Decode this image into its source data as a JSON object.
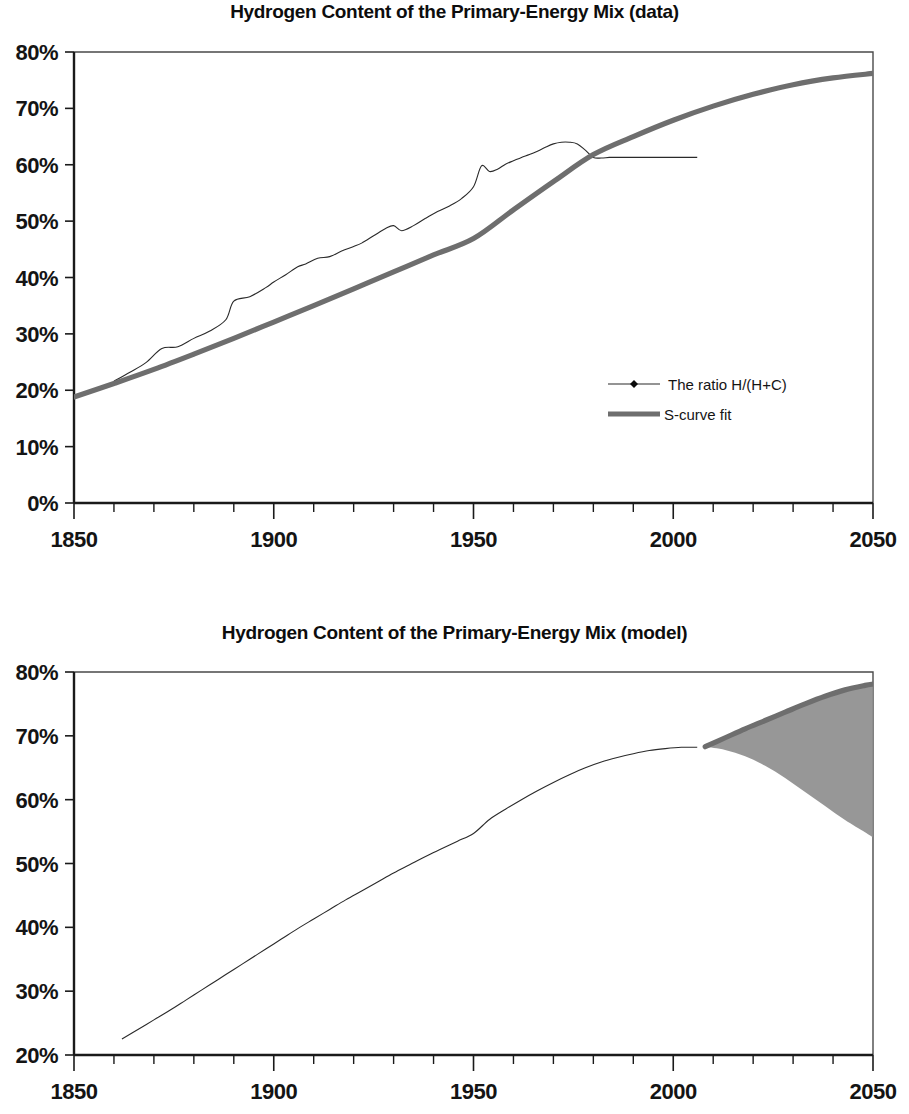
{
  "page": {
    "width": 909,
    "height": 1114,
    "background": "#ffffff",
    "text_color": "#0d0d0d"
  },
  "colors": {
    "scurve_gray": "#6e6e6e",
    "marker_black": "#0b0b0b",
    "band_fill": "#8e8e8e",
    "axis": "#1a1a1a",
    "frame": "#4a4a4a"
  },
  "figures": [
    {
      "id": "figure-data",
      "title": "Hydrogen Content of the Primary-Energy Mix (data)",
      "legend": {
        "position": "inside-right",
        "entries": [
          {
            "label": "The ratio H/(H+C)",
            "style": "line-with-diamond-markers",
            "color": "#2a2a2a"
          },
          {
            "label": "S-curve fit",
            "style": "thick-line",
            "color": "#6e6e6e"
          }
        ]
      }
    },
    {
      "id": "figure-model",
      "title": "Hydrogen Content of the Primary-Energy Mix (model)",
      "legend": {
        "position": "none",
        "entries": []
      }
    }
  ],
  "chart_data": [
    {
      "type": "line",
      "id": "figure-data",
      "title": "Hydrogen Content of the Primary-Energy Mix (data)",
      "xlabel": "",
      "ylabel": "",
      "xlim": [
        1850,
        2050
      ],
      "ylim": [
        0,
        0.8
      ],
      "x_major_ticks": [
        1850,
        1900,
        1950,
        2000,
        2050
      ],
      "x_major_tick_labels": [
        "1850",
        "1900",
        "1950",
        "2000",
        "2050"
      ],
      "x_minor_tick_step": 10,
      "y_ticks": [
        0,
        0.1,
        0.2,
        0.3,
        0.4,
        0.5,
        0.6,
        0.7,
        0.8
      ],
      "y_tick_labels": [
        "0%",
        "10%",
        "20%",
        "30%",
        "40%",
        "50%",
        "60%",
        "70%",
        "80%"
      ],
      "grid": false,
      "legend_position": "inside-right",
      "series": [
        {
          "name": "The ratio H/(H+C)",
          "style": "line-with-diamond-markers",
          "color": "#0b0b0b",
          "x": [
            1860,
            1864,
            1868,
            1872,
            1876,
            1880,
            1884,
            1888,
            1890,
            1894,
            1898,
            1900,
            1903,
            1906,
            1908,
            1911,
            1914,
            1917,
            1920,
            1922,
            1925,
            1928,
            1930,
            1932,
            1935,
            1938,
            1941,
            1944,
            1947,
            1950,
            1952,
            1954,
            1956,
            1958,
            1960,
            1962,
            1964,
            1966,
            1968,
            1970,
            1972,
            1974,
            1976,
            1978,
            1980,
            1982,
            1984,
            1986,
            1988,
            1990,
            1992,
            1994,
            1996,
            1998,
            2000,
            2002,
            2004,
            2006
          ],
          "y": [
            0.216,
            0.232,
            0.249,
            0.274,
            0.277,
            0.292,
            0.305,
            0.325,
            0.358,
            0.366,
            0.382,
            0.392,
            0.405,
            0.419,
            0.424,
            0.434,
            0.437,
            0.447,
            0.455,
            0.461,
            0.474,
            0.487,
            0.492,
            0.483,
            0.492,
            0.505,
            0.517,
            0.527,
            0.54,
            0.561,
            0.598,
            0.588,
            0.592,
            0.601,
            0.607,
            0.613,
            0.618,
            0.624,
            0.631,
            0.637,
            0.64,
            0.64,
            0.637,
            0.626,
            0.613,
            0.612,
            0.613,
            0.613,
            0.613,
            0.613,
            0.613,
            0.613,
            0.613,
            0.613,
            0.613,
            0.613,
            0.613,
            0.613
          ]
        },
        {
          "name": "S-curve fit",
          "style": "thick-line",
          "color": "#6e6e6e",
          "x": [
            1850,
            1860,
            1870,
            1880,
            1890,
            1900,
            1910,
            1920,
            1930,
            1940,
            1950,
            1960,
            1970,
            1980,
            1990,
            2000,
            2010,
            2020,
            2030,
            2040,
            2050
          ],
          "y": [
            0.188,
            0.212,
            0.237,
            0.264,
            0.292,
            0.321,
            0.35,
            0.38,
            0.41,
            0.44,
            0.469,
            0.52,
            0.57,
            0.618,
            0.65,
            0.679,
            0.704,
            0.725,
            0.742,
            0.754,
            0.762
          ]
        }
      ],
      "annotations": [
        {
          "text": "data plateau after 1980 at about 61%",
          "x": 1993,
          "y": 0.613
        }
      ]
    },
    {
      "type": "line",
      "id": "figure-model",
      "title": "Hydrogen Content of the Primary-Energy Mix (model)",
      "xlabel": "",
      "ylabel": "",
      "xlim": [
        1850,
        2050
      ],
      "ylim": [
        0.2,
        0.8
      ],
      "x_major_ticks": [
        1850,
        1900,
        1950,
        2000,
        2050
      ],
      "x_major_tick_labels": [
        "1850",
        "1900",
        "1950",
        "2000",
        "2050"
      ],
      "x_minor_tick_step": 10,
      "y_ticks": [
        0.2,
        0.3,
        0.4,
        0.5,
        0.6,
        0.7,
        0.8
      ],
      "y_tick_labels": [
        "20%",
        "30%",
        "40%",
        "50%",
        "60%",
        "70%",
        "80%"
      ],
      "grid": false,
      "legend_position": "none",
      "series": [
        {
          "name": "model central path",
          "style": "line-with-diamond-markers",
          "color": "#0b0b0b",
          "x": [
            1862,
            1866,
            1870,
            1874,
            1878,
            1882,
            1886,
            1890,
            1894,
            1898,
            1902,
            1906,
            1910,
            1914,
            1918,
            1922,
            1926,
            1930,
            1934,
            1938,
            1942,
            1946,
            1950,
            1954,
            1958,
            1962,
            1966,
            1970,
            1974,
            1978,
            1982,
            1986,
            1990,
            1994,
            1998,
            2002,
            2006
          ],
          "y": [
            0.225,
            0.24,
            0.255,
            0.27,
            0.286,
            0.302,
            0.318,
            0.334,
            0.35,
            0.366,
            0.382,
            0.398,
            0.413,
            0.428,
            0.443,
            0.457,
            0.471,
            0.485,
            0.498,
            0.511,
            0.523,
            0.535,
            0.547,
            0.569,
            0.585,
            0.6,
            0.614,
            0.627,
            0.639,
            0.65,
            0.659,
            0.666,
            0.672,
            0.677,
            0.68,
            0.682,
            0.682
          ]
        },
        {
          "name": "upper envelope",
          "style": "thick-line",
          "color": "#5a5a5a",
          "x": [
            2008,
            2013,
            2018,
            2023,
            2028,
            2033,
            2038,
            2043,
            2048,
            2050
          ],
          "y": [
            0.683,
            0.697,
            0.711,
            0.724,
            0.737,
            0.75,
            0.762,
            0.772,
            0.779,
            0.781
          ]
        },
        {
          "name": "lower envelope",
          "style": "dotted-markers",
          "color": "#3a3a3a",
          "x": [
            2008,
            2013,
            2018,
            2023,
            2028,
            2033,
            2038,
            2043,
            2048,
            2050
          ],
          "y": [
            0.683,
            0.678,
            0.668,
            0.653,
            0.634,
            0.612,
            0.59,
            0.568,
            0.549,
            0.541
          ]
        }
      ],
      "shaded_band": {
        "label": "model uncertainty fan",
        "x_start": 2008,
        "x_end": 2050,
        "fill": "#8e8e8e"
      }
    }
  ]
}
